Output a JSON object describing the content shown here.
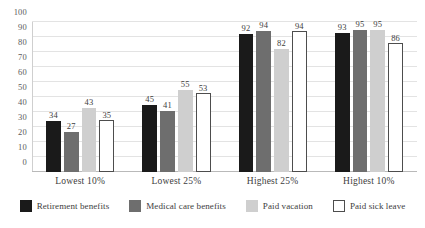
{
  "chart_data": {
    "type": "bar",
    "title": "",
    "subtitle": "",
    "xlabel": "",
    "ylabel": "",
    "ylim": [
      0,
      100
    ],
    "ytick_step": 10,
    "yticks": [
      100,
      90,
      80,
      70,
      60,
      50,
      40,
      30,
      20,
      10,
      0
    ],
    "grid": true,
    "grid_axis": "y",
    "legend_position": "bottom",
    "data_labels": true,
    "categories": [
      "Lowest 10%",
      "Lowest 25%",
      "Highest 25%",
      "Highest 10%"
    ],
    "series": [
      {
        "name": "Retirement benefits",
        "color": "#1a1a1a",
        "values": [
          34,
          45,
          92,
          93
        ]
      },
      {
        "name": "Medical care benefits",
        "color": "#6e6e6e",
        "values": [
          27,
          41,
          94,
          95
        ]
      },
      {
        "name": "Paid vacation",
        "color": "#cfcfcf",
        "values": [
          43,
          55,
          82,
          95
        ]
      },
      {
        "name": "Paid sick leave",
        "color": "#ffffff",
        "values": [
          35,
          53,
          94,
          86
        ]
      }
    ]
  },
  "colors": {
    "background": "#ffffff",
    "gridline": "#e3e3e3",
    "axis": "#b9b9b9",
    "text": "#3d3d3d",
    "tick_text": "#5b5b5b",
    "outline": "#4d4d4d"
  }
}
